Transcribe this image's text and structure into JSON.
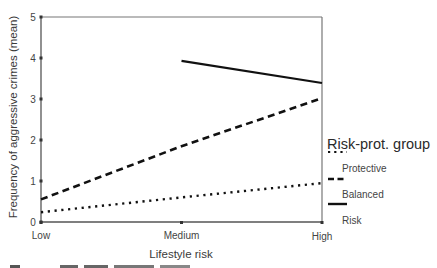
{
  "chart_data": {
    "type": "line",
    "title": "",
    "xlabel": "Lifestyle risk",
    "ylabel": "Frequency of aggressive crimes (mean)",
    "categories": [
      "Low",
      "Medium",
      "High"
    ],
    "y_ticks": [
      0,
      1,
      2,
      3,
      4,
      5
    ],
    "ylim": [
      0,
      5
    ],
    "grid": false,
    "legend": {
      "title": "Risk-prot. group",
      "position": "right",
      "entries": [
        {
          "label": "Protective",
          "style": "dotted"
        },
        {
          "label": "Balanced",
          "style": "dashed"
        },
        {
          "label": "Risk",
          "style": "solid"
        }
      ]
    },
    "series": [
      {
        "name": "Protective",
        "style": "dotted",
        "values": [
          0.24,
          0.6,
          0.95
        ]
      },
      {
        "name": "Balanced",
        "style": "dashed",
        "values": [
          0.55,
          1.85,
          3.02
        ]
      },
      {
        "name": "Risk",
        "style": "solid",
        "values": [
          null,
          3.93,
          3.39
        ]
      }
    ],
    "colors": {
      "line": "#111111",
      "axis": "#555555"
    }
  }
}
